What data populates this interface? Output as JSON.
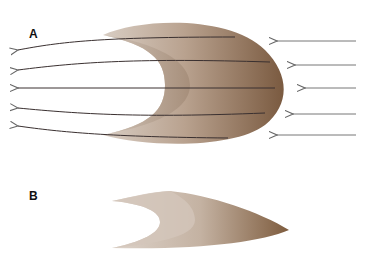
{
  "figure": {
    "panels": [
      {
        "id": "A",
        "label": "A",
        "description": "crescent shape with flow lines passing through, incoming arrows from right"
      },
      {
        "id": "B",
        "label": "B",
        "description": "elongated pointed crescent shape"
      }
    ],
    "incoming_arrows": 5,
    "outgoing_arrows": 5,
    "colors": {
      "shape_dark": "#7a5a40",
      "shape_light": "#d9cfc6",
      "arrow": "#777777",
      "flow_line": "#3a3030"
    }
  }
}
